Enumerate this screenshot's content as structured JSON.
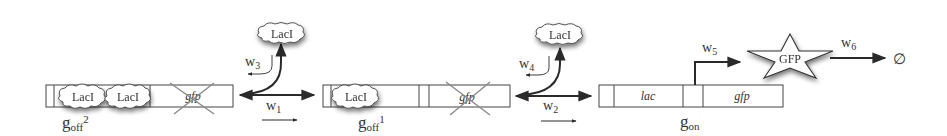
{
  "diagram": {
    "type": "gene-regulation-reaction-scheme",
    "colors": {
      "line": "#2a2a2a",
      "box_stroke": "#444444",
      "cross": "#8a8a8a",
      "shadow": "#6a6a6a",
      "text": "#333333"
    },
    "states": [
      {
        "id": "g_off2",
        "label_main": "g",
        "label_sub": "off",
        "label_sup": "2",
        "bound_repressors": [
          "LacI",
          "LacI"
        ],
        "gene_label": "gfp",
        "gene_crossed": true
      },
      {
        "id": "g_off1",
        "label_main": "g",
        "label_sub": "off",
        "label_sup": "1",
        "bound_repressors": [
          "LacI"
        ],
        "gene_label": "gfp",
        "gene_crossed": true
      },
      {
        "id": "g_on",
        "label_main": "g",
        "label_sub": "on",
        "label_sup": "",
        "operator_label": "lac",
        "gene_label": "gfp",
        "gene_crossed": false
      }
    ],
    "reactions": [
      {
        "id": "w1",
        "label_main": "w",
        "label_sub": "1",
        "from": "g_off2",
        "to": "g_off1",
        "reversible": true
      },
      {
        "id": "w3",
        "label_main": "w",
        "label_sub": "3",
        "releases": "LacI"
      },
      {
        "id": "w2",
        "label_main": "w",
        "label_sub": "2",
        "from": "g_off1",
        "to": "g_on",
        "reversible": true
      },
      {
        "id": "w4",
        "label_main": "w",
        "label_sub": "4",
        "releases": "LacI"
      },
      {
        "id": "w5",
        "label_main": "w",
        "label_sub": "5",
        "from": "g_on",
        "to": "GFP",
        "kind": "expression"
      },
      {
        "id": "w6",
        "label_main": "w",
        "label_sub": "6",
        "from": "GFP",
        "to": "∅",
        "kind": "degradation"
      }
    ],
    "free_species": {
      "repressor_1": "LacI",
      "repressor_2": "LacI",
      "product": "GFP",
      "sink": "∅"
    }
  }
}
